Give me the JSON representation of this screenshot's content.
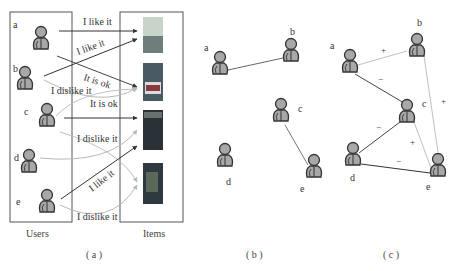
{
  "panel_a": {
    "caption": "( a )",
    "users_label": "Users",
    "items_label": "Items",
    "users": [
      {
        "id": "a",
        "label": "a"
      },
      {
        "id": "b",
        "label": "b"
      },
      {
        "id": "c",
        "label": "c"
      },
      {
        "id": "d",
        "label": "d"
      },
      {
        "id": "e",
        "label": "e"
      }
    ],
    "items": [
      {
        "id": "item1",
        "colors": [
          "#c8d4c8",
          "#6e7e7a"
        ]
      },
      {
        "id": "item2",
        "colors": [
          "#4a5a62",
          "#8a3a3a"
        ]
      },
      {
        "id": "item3",
        "colors": [
          "#2a3238",
          "#4a5248"
        ]
      },
      {
        "id": "item4",
        "colors": [
          "#2e3a40",
          "#5a6a5a"
        ]
      }
    ],
    "ratings": [
      {
        "from": "a",
        "to": "item1",
        "text": "I like it",
        "style": "dark"
      },
      {
        "from": "b",
        "to": "item1",
        "text": "I like it",
        "style": "dark"
      },
      {
        "from": "a",
        "to": "item2",
        "text": "It is ok",
        "style": "dark"
      },
      {
        "from": "b",
        "to": "item2",
        "text": "It is ok",
        "style": "light"
      },
      {
        "from": "c",
        "to": "item2",
        "text": "I dislike it",
        "style": "light"
      },
      {
        "from": "c",
        "to": "item3",
        "text": "",
        "style": "dark"
      },
      {
        "from": "d",
        "to": "item3",
        "text": "I dislike it",
        "style": "light"
      },
      {
        "from": "e",
        "to": "item3",
        "text": "I like it",
        "style": "dark"
      },
      {
        "from": "e",
        "to": "item4",
        "text": "I dislike it",
        "style": "light"
      }
    ],
    "texts": {
      "t1": "I like it",
      "t2": "I like it",
      "t3": "It is ok",
      "t4": "I dislike it",
      "t5": "It is ok",
      "t6": "I dislike it",
      "t7": "I like it",
      "t8": "I dislike it"
    }
  },
  "panel_b": {
    "caption": "( b )",
    "users": [
      {
        "id": "a",
        "label": "a"
      },
      {
        "id": "b",
        "label": "b"
      },
      {
        "id": "c",
        "label": "c"
      },
      {
        "id": "d",
        "label": "d"
      },
      {
        "id": "e",
        "label": "e"
      }
    ],
    "edges": [
      {
        "from": "a",
        "to": "b"
      },
      {
        "from": "c",
        "to": "e"
      }
    ]
  },
  "panel_c": {
    "caption": "( c )",
    "users": [
      {
        "id": "a",
        "label": "a"
      },
      {
        "id": "b",
        "label": "b"
      },
      {
        "id": "c",
        "label": "c"
      },
      {
        "id": "d",
        "label": "d"
      },
      {
        "id": "e",
        "label": "e"
      }
    ],
    "edges": [
      {
        "from": "a",
        "to": "b",
        "sign": "+"
      },
      {
        "from": "a",
        "to": "c",
        "sign": "−"
      },
      {
        "from": "b",
        "to": "e",
        "sign": "+"
      },
      {
        "from": "c",
        "to": "d",
        "sign": "−"
      },
      {
        "from": "c",
        "to": "e",
        "sign": "+"
      },
      {
        "from": "d",
        "to": "e",
        "sign": "−"
      }
    ]
  },
  "colors": {
    "person_fill": "#a8a8a8",
    "person_stroke": "#333333",
    "dark_edge": "#333333",
    "light_edge": "#b8b8b8",
    "box_stroke": "#555555"
  }
}
